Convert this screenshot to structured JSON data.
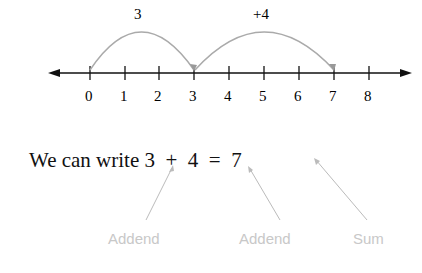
{
  "number_line": {
    "ticks": [
      "0",
      "1",
      "2",
      "3",
      "4",
      "5",
      "6",
      "7",
      "8"
    ],
    "jumps": [
      {
        "label": "3",
        "from": 0,
        "to": 3
      },
      {
        "label": "+4",
        "from": 3,
        "to": 7
      }
    ]
  },
  "sentence": {
    "prefix": "We can write",
    "a": "3",
    "plus": "+",
    "b": "4",
    "equals": "=",
    "sum": "7"
  },
  "labels": {
    "addend1": "Addend",
    "addend2": "Addend",
    "sum": "Sum"
  },
  "colors": {
    "text": "#111111",
    "arc": "#aaaaaa",
    "label": "#c8c8c8"
  }
}
